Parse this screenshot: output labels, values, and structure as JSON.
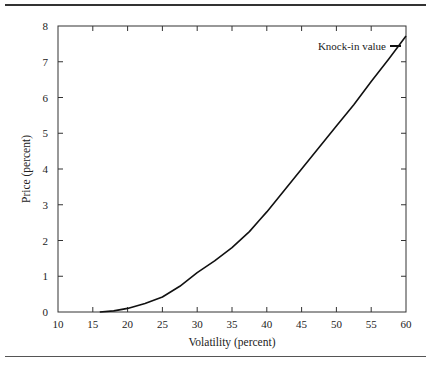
{
  "chart_data": {
    "type": "line",
    "title": "",
    "xlabel": "Volatility (percent)",
    "ylabel": "Price (percent)",
    "xlim": [
      10,
      60
    ],
    "ylim": [
      0,
      8
    ],
    "xticks": [
      10,
      15,
      20,
      25,
      30,
      35,
      40,
      45,
      50,
      55,
      60
    ],
    "yticks": [
      0,
      1,
      2,
      3,
      4,
      5,
      6,
      7,
      8
    ],
    "grid": false,
    "legend_position": "top-right",
    "series": [
      {
        "name": "Knock-in value",
        "color": "#111111",
        "x": [
          16,
          18,
          20,
          22.5,
          25,
          27.5,
          30,
          32.5,
          35,
          37.5,
          39,
          40,
          42.5,
          45,
          47.5,
          50,
          52.5,
          55,
          57.5,
          60
        ],
        "y": [
          0.0,
          0.03,
          0.1,
          0.24,
          0.42,
          0.72,
          1.1,
          1.43,
          1.8,
          2.25,
          2.58,
          2.8,
          3.4,
          4.0,
          4.6,
          5.2,
          5.8,
          6.45,
          7.07,
          7.72
        ]
      }
    ]
  },
  "legend": {
    "label": "Knock-in value"
  },
  "axes": {
    "xlabel": "Volatility (percent)",
    "ylabel": "Price (percent)"
  }
}
